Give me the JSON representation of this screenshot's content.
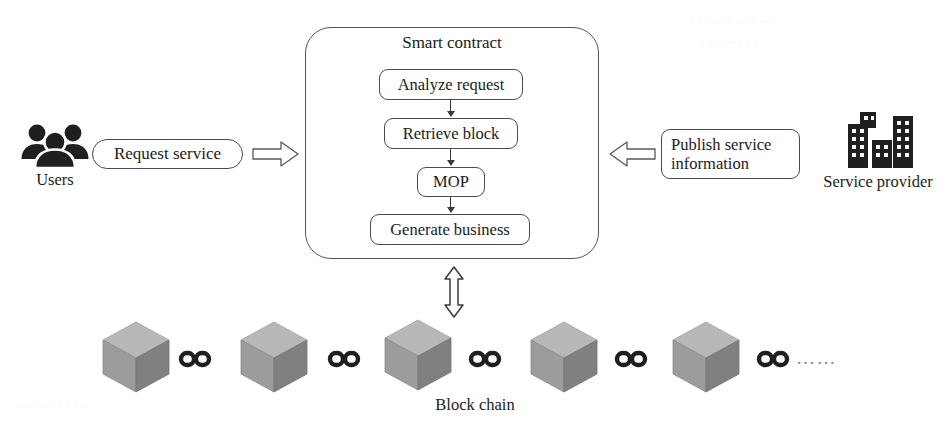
{
  "diagram": {
    "smart_contract": {
      "label": "Smart contract",
      "steps": [
        {
          "label": "Analyze request"
        },
        {
          "label": "Retrieve block"
        },
        {
          "label": "MOP"
        },
        {
          "label": "Generate business"
        }
      ]
    },
    "left_actor": {
      "icon": "users-icon",
      "caption": "Users",
      "message": "Request service",
      "arrow_direction": "right"
    },
    "right_actor": {
      "icon": "buildings-icon",
      "caption": "Service provider",
      "message": "Publish service information",
      "message_line_1": "Publish service",
      "message_line_2": "information",
      "arrow_direction": "left"
    },
    "blockchain": {
      "caption": "Block chain",
      "block_count": 5,
      "link_count": 5,
      "ellipsis": "……",
      "sync_arrow": "double-headed-vertical"
    },
    "colors": {
      "stroke": "#4a4a4a",
      "text": "#1b1b1b",
      "icon_dark": "#1f1f1f",
      "cube_top": "#b4b4b4",
      "cube_left": "#9a9a9a",
      "cube_right": "#7e7e7e",
      "background": "#ffffff"
    },
    "watermarks": [
      "· · · · · · · · · · ·",
      "· · · · · · · ·",
      "· · · · · · · · ·"
    ]
  }
}
